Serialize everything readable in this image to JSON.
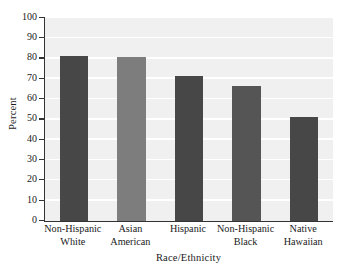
{
  "chart_data": {
    "type": "bar",
    "title": "",
    "xlabel": "Race/Ethnicity",
    "ylabel": "Percent",
    "ylim": [
      0,
      100
    ],
    "yticks": [
      0,
      10,
      20,
      30,
      40,
      50,
      60,
      70,
      80,
      90,
      100
    ],
    "ytick_labels": [
      "0",
      "10",
      "20",
      "30",
      "40",
      "50",
      "60",
      "70",
      "80",
      "90",
      "100"
    ],
    "grid": true,
    "legend": "none",
    "categories": [
      "Non-Hispanic White",
      "Asian American",
      "Hispanic",
      "Non-Hispanic Black",
      "Native Hawaiian"
    ],
    "category_lines": [
      {
        "line1": "Non-Hispanic",
        "line2": "White"
      },
      {
        "line1": "Asian",
        "line2": "American"
      },
      {
        "line1": "Hispanic",
        "line2": ""
      },
      {
        "line1": "Non-Hispanic",
        "line2": "Black"
      },
      {
        "line1": "Native",
        "line2": "Hawaiian"
      }
    ],
    "values": [
      81.5,
      80.7,
      71.5,
      66.5,
      51.3
    ],
    "bar_colors": [
      "#474747",
      "#7d7d7d",
      "#474747",
      "#555555",
      "#474747"
    ],
    "plot_background": "#f0f0f0",
    "gridline_color": "#ffffff",
    "axis_color": "#333333"
  }
}
